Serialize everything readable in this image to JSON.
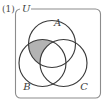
{
  "figure": {
    "number_label": "(1)",
    "universe_label": "U",
    "caption": "",
    "background_color": "#ffffff",
    "border_color": "#8c8c8c",
    "circle_stroke_color": "#3a3a3a",
    "shade_color": "#b3b3b3",
    "shaded_region_description": "A ∩ B excluding C"
  },
  "sets": [
    {
      "id": "A",
      "label": "A",
      "label_x": 57.5,
      "label_y": 25.5,
      "cx": 52.0,
      "cy": 44.0,
      "r": 23.5
    },
    {
      "id": "B",
      "label": "B",
      "label_x": 27.0,
      "label_y": 90.0,
      "cx": 42.5,
      "cy": 63.0,
      "r": 23.5
    },
    {
      "id": "C",
      "label": "C",
      "label_x": 84.0,
      "label_y": 90.0,
      "cx": 63.5,
      "cy": 63.0,
      "r": 23.5
    }
  ],
  "universe_box": {
    "x": 15.5,
    "y": 9.0,
    "width": 85.0,
    "height": 89.0,
    "corner_radius": 5.0,
    "label_gap_start": 20.0,
    "label_gap_end": 31.0
  },
  "label_positions": {
    "figure_number_x": 2.0,
    "figure_number_y": 12.0,
    "universe_label_x": 22.0,
    "universe_label_y": 11.5
  }
}
